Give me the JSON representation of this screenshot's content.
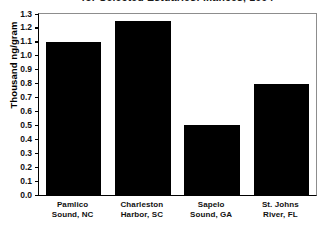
{
  "chart_data": {
    "type": "bar",
    "title": "for Selected Estuaries: ...ances, 1994",
    "xlabel": "",
    "ylabel": "Thousand ng/gram",
    "ylim": [
      0.0,
      1.3
    ],
    "grid": false,
    "legend": "none",
    "bar_color": "#000000",
    "categories": [
      "Pamlico Sound, NC",
      "Charleston Harbor, SC",
      "Sapelo Sound, GA",
      "St. Johns River, FL"
    ],
    "category_lines": [
      [
        "Pamlico",
        "Sound, NC"
      ],
      [
        "Charleston",
        "Harbor, SC"
      ],
      [
        "Sapelo",
        "Sound, GA"
      ],
      [
        "St. Johns",
        "River, FL"
      ]
    ],
    "values": [
      1.1,
      1.25,
      0.5,
      0.8
    ],
    "ytick_labels": [
      "1.3",
      "1.2",
      "1.1",
      "1.0",
      "0.9",
      "0.8",
      "0.7",
      "0.6",
      "0.5",
      "0.4",
      "0.3",
      "0.2",
      "0.1",
      "0.0"
    ],
    "ytick_values": [
      1.3,
      1.2,
      1.1,
      1.0,
      0.9,
      0.8,
      0.7,
      0.6,
      0.5,
      0.4,
      0.3,
      0.2,
      0.1,
      0.0
    ]
  }
}
